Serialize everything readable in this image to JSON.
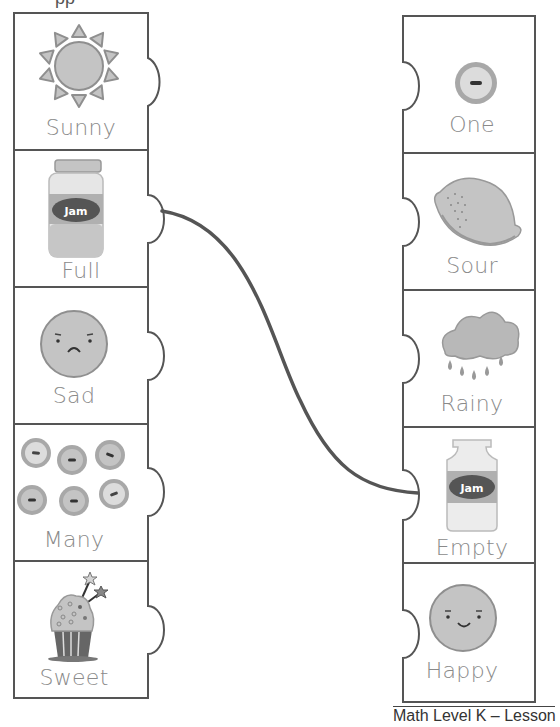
{
  "worksheet": {
    "top_fragment": "pp",
    "footer": "Math Level K – Lesson 7",
    "colors": {
      "outline": "#555555",
      "icon_fill": "#c4c4c4",
      "icon_stroke": "#8f8f8f",
      "label_text": "#8a8a8a",
      "connector": "#555555"
    },
    "left_column": [
      {
        "label": "Sunny",
        "icon": "sun-icon"
      },
      {
        "label": "Full",
        "icon": "full-jam-jar-icon",
        "jar_label": "Jam"
      },
      {
        "label": "Sad",
        "icon": "sad-face-icon"
      },
      {
        "label": "Many",
        "icon": "many-buttons-icon"
      },
      {
        "label": "Sweet",
        "icon": "cupcake-icon"
      }
    ],
    "right_column": [
      {
        "label": "One",
        "icon": "one-button-icon"
      },
      {
        "label": "Sour",
        "icon": "lemon-icon"
      },
      {
        "label": "Rainy",
        "icon": "rain-cloud-icon"
      },
      {
        "label": "Empty",
        "icon": "empty-jam-jar-icon",
        "jar_label": "Jam"
      },
      {
        "label": "Happy",
        "icon": "happy-face-icon"
      }
    ],
    "connections": [
      {
        "from": "Full",
        "to": "Empty"
      }
    ]
  }
}
